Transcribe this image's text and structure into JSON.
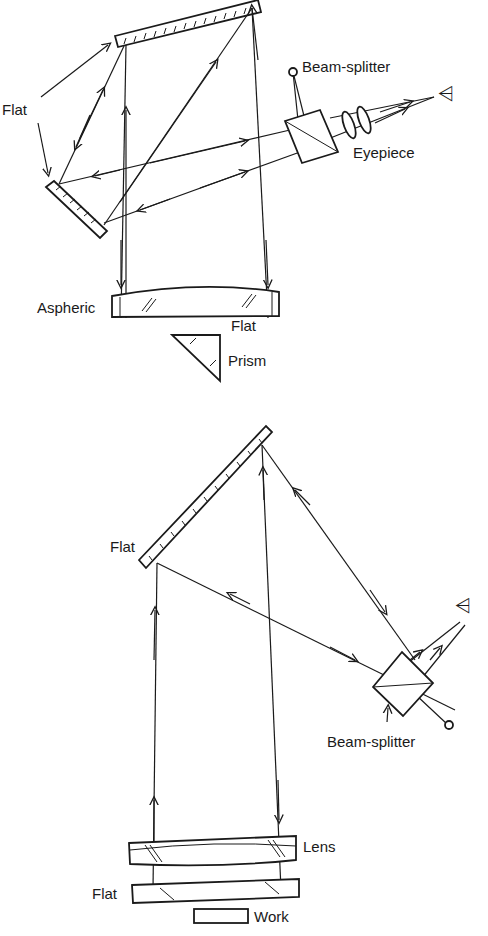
{
  "diagram": {
    "top_setup": {
      "labels": {
        "flat": "Flat",
        "beam_splitter": "Beam-splitter",
        "eyepiece": "Eyepiece",
        "aspheric": "Aspheric",
        "flat_lower": "Flat",
        "prism": "Prism"
      },
      "components": [
        "top flat mirror",
        "left flat mirror",
        "beam-splitter cube",
        "eyepiece lenses",
        "eye",
        "aspheric plate",
        "flat",
        "prism",
        "light source"
      ]
    },
    "bottom_setup": {
      "labels": {
        "flat": "Flat",
        "beam_splitter": "Beam-splitter",
        "lens": "Lens",
        "flat_lower": "Flat",
        "work": "Work"
      },
      "components": [
        "diagonal flat mirror",
        "beam-splitter cube",
        "eye",
        "light source",
        "lens",
        "flat",
        "work piece"
      ]
    }
  }
}
